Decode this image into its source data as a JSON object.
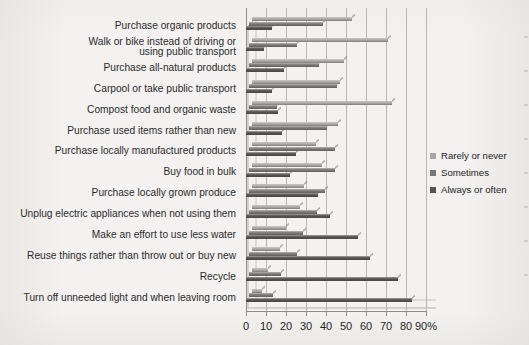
{
  "chart_data": {
    "type": "bar",
    "orientation": "horizontal",
    "title": "",
    "subtitle": "",
    "xlabel": "",
    "ylabel": "",
    "xlim": [
      0,
      90
    ],
    "xunit": "%",
    "grid": true,
    "legend_position": "right",
    "xticks": [
      {
        "value": 0,
        "label": "0"
      },
      {
        "value": 10,
        "label": "10"
      },
      {
        "value": 20,
        "label": "20"
      },
      {
        "value": 30,
        "label": "30"
      },
      {
        "value": 40,
        "label": "40"
      },
      {
        "value": 50,
        "label": "50"
      },
      {
        "value": 60,
        "label": "60"
      },
      {
        "value": 70,
        "label": "70"
      },
      {
        "value": 80,
        "label": "80"
      },
      {
        "value": 90,
        "label": "90%"
      }
    ],
    "categories": [
      "Purchase organic products",
      "Walk or bike instead of driving or\nusing public transport",
      "Purchase all-natural products",
      "Carpool or take public transport",
      "Compost food and organic waste",
      "Purchase used items rather than new",
      "Purchase locally manufactured products",
      "Buy food in bulk",
      "Purchase locally grown produce",
      "Unplug electric appliances when not using them",
      "Make an effort to use less water",
      "Reuse things rather than throw out or buy new",
      "Recycle",
      "Turn off unneeded light and when leaving room"
    ],
    "series": [
      {
        "name": "Rarely or never",
        "color": "#a7a5a3",
        "values": [
          50,
          68,
          46,
          44,
          70,
          43,
          32,
          35,
          26,
          24,
          17,
          14,
          8,
          5
        ]
      },
      {
        "name": "Sometimes",
        "color": "#7a7876",
        "values": [
          37,
          24,
          35,
          44,
          14,
          39,
          43,
          43,
          38,
          34,
          27,
          24,
          16,
          12
        ]
      },
      {
        "name": "Always or often",
        "color": "#565452",
        "values": [
          13,
          9,
          19,
          13,
          16,
          18,
          25,
          22,
          36,
          42,
          56,
          62,
          76,
          83
        ]
      }
    ]
  },
  "legend": {
    "items": [
      {
        "label": "Rarely or never",
        "color": "#a7a5a3"
      },
      {
        "label": "Sometimes",
        "color": "#7a7876"
      },
      {
        "label": "Always or often",
        "color": "#565452"
      }
    ]
  }
}
